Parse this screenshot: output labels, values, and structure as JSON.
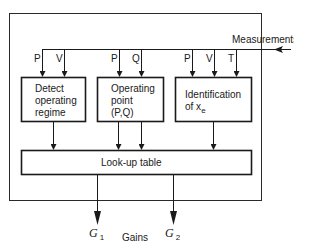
{
  "diagram": {
    "type": "block-diagram",
    "input": {
      "label": "Measurements"
    },
    "blocks": [
      {
        "id": "detect",
        "label_lines": [
          "Detect",
          "operating",
          "regime"
        ],
        "inputs": [
          "P",
          "V"
        ]
      },
      {
        "id": "operating_point",
        "label_lines": [
          "Operating",
          "point",
          "(P,Q)"
        ],
        "inputs": [
          "P",
          "Q"
        ]
      },
      {
        "id": "identification",
        "label_lines": [
          "Identification",
          "of x"
        ],
        "label_subscript": "e",
        "inputs": [
          "P",
          "V",
          "T"
        ]
      }
    ],
    "lookup": {
      "label": "Look-up table"
    },
    "outputs": {
      "group_label": "Gains",
      "items": [
        {
          "symbol": "G",
          "subscript": "1"
        },
        {
          "symbol": "G",
          "subscript": "2"
        }
      ]
    }
  }
}
